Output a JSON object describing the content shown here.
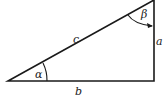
{
  "diagram": {
    "sides": {
      "hypotenuse": "c",
      "vertical": "a",
      "horizontal": "b"
    },
    "angles": {
      "bottom_left": "α",
      "top_right": "β"
    },
    "colors": {
      "stroke": "#1a1a1a",
      "background": "#ffffff"
    }
  }
}
